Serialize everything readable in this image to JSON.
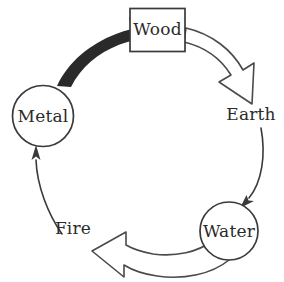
{
  "diagram": {
    "background_color": "#ffffff",
    "stroke_color": "#3a3a3a",
    "thick_arrow_color": "#2a2a2a",
    "hollow_arrow_fill": "#ffffff",
    "nodes": [
      {
        "id": "wood",
        "label": "Wood",
        "shape": "rectangle",
        "x": 157,
        "y": 30,
        "width": 55,
        "height": 43
      },
      {
        "id": "earth",
        "label": "Earth",
        "shape": "none",
        "x": 250,
        "y": 114,
        "width": 58,
        "height": 22
      },
      {
        "id": "water",
        "label": "Water",
        "shape": "circle",
        "x": 229,
        "y": 231,
        "width": 58,
        "height": 58
      },
      {
        "id": "fire",
        "label": "Fire",
        "shape": "none",
        "x": 73,
        "y": 229,
        "width": 44,
        "height": 22
      },
      {
        "id": "metal",
        "label": "Metal",
        "shape": "circle",
        "x": 43,
        "y": 116,
        "width": 61,
        "height": 61
      }
    ],
    "edges": [
      {
        "id": "metal-to-wood",
        "from": "metal",
        "to": "wood",
        "style": "thick-filled",
        "color": "#2a2a2a"
      },
      {
        "id": "wood-to-earth",
        "from": "wood",
        "to": "earth",
        "style": "hollow-outline",
        "color": "#4a4a4a"
      },
      {
        "id": "earth-to-water",
        "from": "earth",
        "to": "water",
        "style": "thin-line",
        "color": "#3a3a3a"
      },
      {
        "id": "water-to-fire",
        "from": "water",
        "to": "fire",
        "style": "hollow-outline",
        "color": "#4a4a4a"
      },
      {
        "id": "fire-to-metal",
        "from": "fire",
        "to": "metal",
        "style": "thin-line",
        "color": "#3a3a3a"
      }
    ]
  }
}
